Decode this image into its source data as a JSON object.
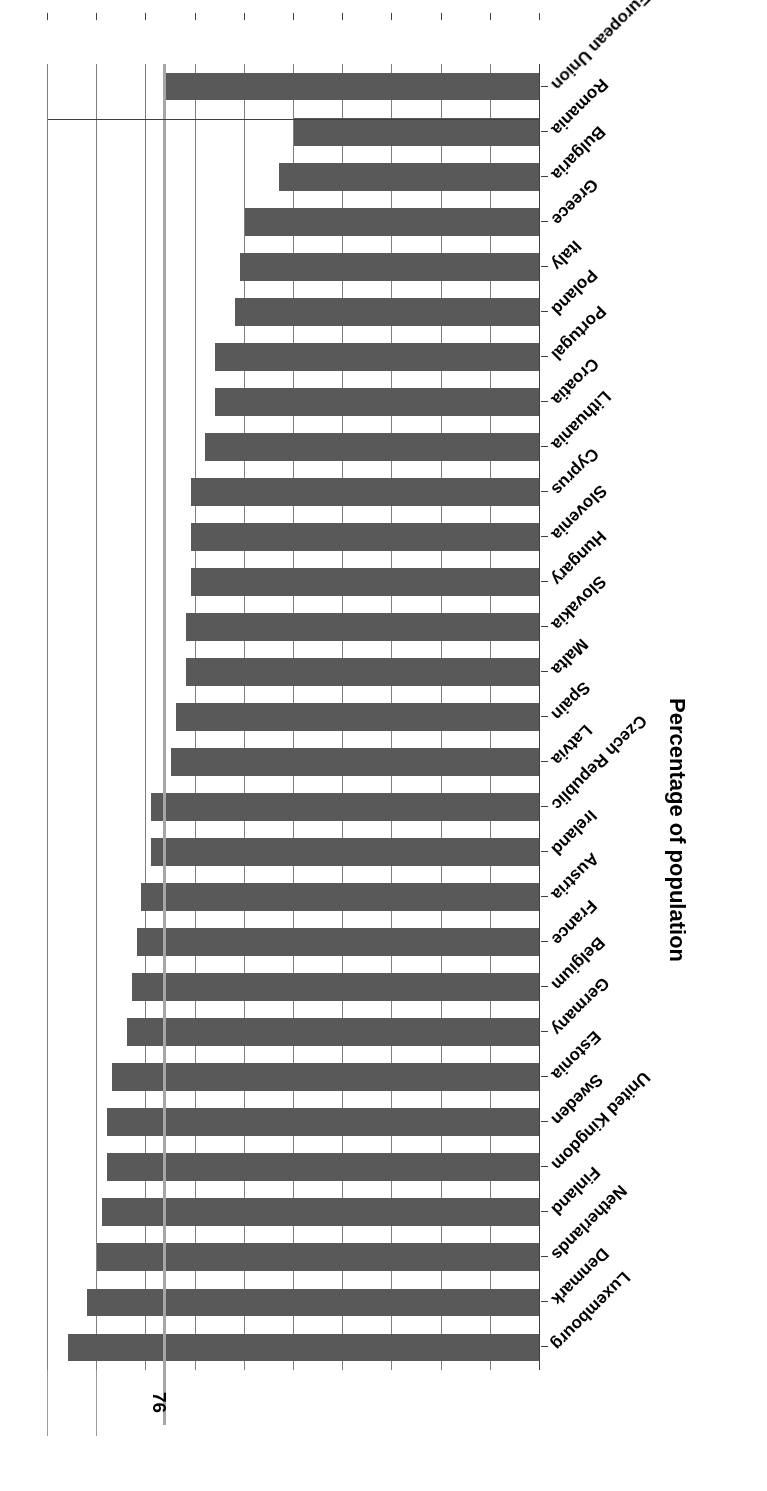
{
  "chart_data": {
    "type": "bar",
    "orientation": "horizontal",
    "title": "",
    "xlabel": "Percentage of population",
    "ylabel": "",
    "axis_title": "Percentage of population",
    "xlim": [
      0,
      100
    ],
    "x_ticks": [
      0,
      10,
      20,
      30,
      40,
      50,
      60,
      70,
      80,
      90,
      100
    ],
    "x_tick_labels": [
      "0",
      "10",
      "20",
      "30",
      "40",
      "50",
      "60",
      "70",
      "80",
      "90",
      "100"
    ],
    "grid": true,
    "legend": false,
    "bar_color": "#595959",
    "reference_line": {
      "value": 76,
      "label": "76",
      "color": "#a6a6a6"
    },
    "categories": [
      "Luxembourg",
      "Denmark",
      "Netherlands",
      "Finland",
      "United Kingdom",
      "Sweden",
      "Estonia",
      "Germany",
      "Belgium",
      "France",
      "Austria",
      "Ireland",
      "Czech Republic",
      "Latvia",
      "Spain",
      "Malta",
      "Slovakia",
      "Hungary",
      "Slovenia",
      "Cyprus",
      "Lithuania",
      "Croatia",
      "Portugal",
      "Poland",
      "Italy",
      "Greece",
      "Bulgaria",
      "Romania",
      "European Union"
    ],
    "values": [
      96,
      92,
      90,
      89,
      88,
      88,
      87,
      84,
      83,
      82,
      81,
      79,
      79,
      75,
      74,
      72,
      72,
      71,
      71,
      71,
      68,
      66,
      66,
      62,
      61,
      60,
      53,
      50,
      76
    ]
  }
}
